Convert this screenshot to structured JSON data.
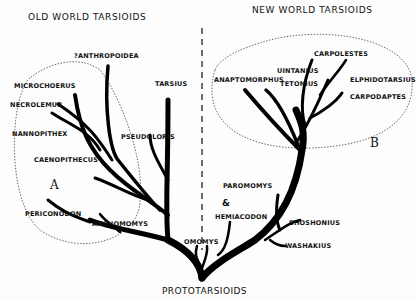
{
  "headers": {
    "old_world": "OLD WORLD TARSIOIDS",
    "new_world": "NEW WORLD TARSIOIDS"
  },
  "root_label": "PROTOTARSIOIDS",
  "groups": {
    "a": "A",
    "b": "B"
  },
  "old_world_taxa": [
    "?Anthropoidea",
    "Microchoerus",
    "Necrolemur",
    "Nannopithex",
    "Caenopithecus",
    "Tarsius",
    "Pseudoloris",
    "Periconodon",
    "Anchomomys"
  ],
  "new_world_taxa": [
    "Carpolestes",
    "Uintanius",
    "Anaptomorphus",
    "Tetonius",
    "Elphidotarsius",
    "Carpodaptes",
    "Paromomys",
    "&",
    "Hemiacodon",
    "Omomys",
    "Shoshonius",
    "Washakius"
  ]
}
